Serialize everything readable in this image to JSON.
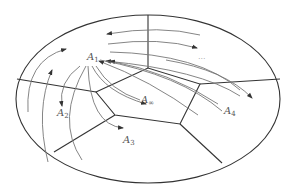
{
  "diagram": {
    "type": "tessellated-ellipse-with-flow-arrows",
    "colors": {
      "outline": "#333333",
      "flow": "#777777",
      "label": "#555555",
      "background": "#ffffff"
    },
    "labels": {
      "A1": {
        "base": "A",
        "sub": "1"
      },
      "A2": {
        "base": "A",
        "sub": "2"
      },
      "A3": {
        "base": "A",
        "sub": "3"
      },
      "A4": {
        "base": "A",
        "sub": "4"
      },
      "Ainf": {
        "base": "A",
        "sub": "∞"
      },
      "ellipsis": "···"
    }
  }
}
